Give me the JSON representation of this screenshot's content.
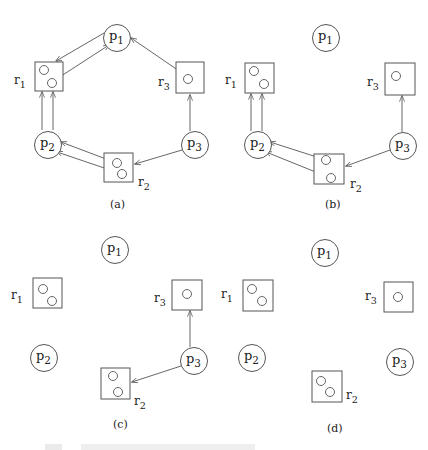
{
  "figure": {
    "stroke_color": "#555555",
    "panels": [
      {
        "id": "a",
        "label": "(a)",
        "label_pos": [
          110,
          208
        ],
        "processes": [
          {
            "name": "p",
            "sub": "1",
            "cx": 117,
            "cy": 38
          },
          {
            "name": "p",
            "sub": "2",
            "cx": 48,
            "cy": 145
          },
          {
            "name": "p",
            "sub": "3",
            "cx": 195,
            "cy": 145
          }
        ],
        "resources": [
          {
            "name": "r",
            "sub": "1",
            "x": 35,
            "y": 62,
            "w": 28,
            "h": 29,
            "label_pos": [
              14,
              84
            ],
            "units": [
              [
                44,
                70
              ],
              [
                52,
                83
              ]
            ]
          },
          {
            "name": "r",
            "sub": "2",
            "x": 104,
            "y": 153,
            "w": 29,
            "h": 29,
            "label_pos": [
              138,
              186
            ],
            "units": [
              [
                117,
                163
              ],
              [
                122,
                174
              ]
            ]
          },
          {
            "name": "r",
            "sub": "3",
            "x": 176,
            "y": 62,
            "w": 28,
            "h": 31,
            "label_pos": [
              158,
              86
            ],
            "units": [
              [
                188,
                79
              ]
            ]
          }
        ],
        "edges": [
          {
            "from": [
              104,
              33
            ],
            "to": [
              56,
              61
            ],
            "type": "request"
          },
          {
            "from": [
              55,
              80
            ],
            "to": [
              109,
              45
            ],
            "type": "assignment"
          },
          {
            "from": [
              185,
              75
            ],
            "to": [
              131,
              38
            ],
            "type": "assignment"
          },
          {
            "from": [
              42,
              130
            ],
            "to": [
              42,
              92
            ],
            "type": "request"
          },
          {
            "from": [
              53,
              130
            ],
            "to": [
              53,
              92
            ],
            "type": "request"
          },
          {
            "from": [
              114,
              162
            ],
            "to": [
              61,
              142
            ],
            "type": "assignment"
          },
          {
            "from": [
              119,
              173
            ],
            "to": [
              57,
              152
            ],
            "type": "assignment"
          },
          {
            "from": [
              182,
              150
            ],
            "to": [
              135,
              164
            ],
            "type": "request"
          },
          {
            "from": [
              190,
              131
            ],
            "to": [
              190,
              95
            ],
            "type": "request"
          }
        ]
      },
      {
        "id": "b",
        "label": "(b)",
        "label_pos": [
          325,
          208
        ],
        "processes": [
          {
            "name": "p",
            "sub": "1",
            "cx": 326,
            "cy": 38
          },
          {
            "name": "p",
            "sub": "2",
            "cx": 258,
            "cy": 145
          },
          {
            "name": "p",
            "sub": "3",
            "cx": 403,
            "cy": 146
          }
        ],
        "resources": [
          {
            "name": "r",
            "sub": "1",
            "x": 245,
            "y": 63,
            "w": 29,
            "h": 30,
            "label_pos": [
              225,
              84
            ],
            "units": [
              [
                254,
                71
              ],
              [
                264,
                84
              ]
            ]
          },
          {
            "name": "r",
            "sub": "2",
            "x": 314,
            "y": 154,
            "w": 30,
            "h": 30,
            "label_pos": [
              350,
              188
            ],
            "units": [
              [
                326,
                160
              ],
              [
                331,
                178
              ]
            ]
          },
          {
            "name": "r",
            "sub": "3",
            "x": 385,
            "y": 63,
            "w": 30,
            "h": 32,
            "label_pos": [
              367,
              86
            ],
            "units": [
              [
                396,
                76
              ]
            ]
          }
        ],
        "edges": [
          {
            "from": [
              251,
              131
            ],
            "to": [
              251,
              94
            ],
            "type": "request"
          },
          {
            "from": [
              262,
              131
            ],
            "to": [
              262,
              94
            ],
            "type": "request"
          },
          {
            "from": [
              323,
              159
            ],
            "to": [
              270,
              142
            ],
            "type": "assignment"
          },
          {
            "from": [
              328,
              177
            ],
            "to": [
              266,
              152
            ],
            "type": "assignment"
          },
          {
            "from": [
              390,
              150
            ],
            "to": [
              346,
              166
            ],
            "type": "request"
          },
          {
            "from": [
              402,
              132
            ],
            "to": [
              402,
              96
            ],
            "type": "request"
          }
        ]
      },
      {
        "id": "c",
        "label": "(c)",
        "label_pos": [
          113,
          428
        ],
        "processes": [
          {
            "name": "p",
            "sub": "1",
            "cx": 115,
            "cy": 250
          },
          {
            "name": "p",
            "sub": "2",
            "cx": 44,
            "cy": 358
          },
          {
            "name": "p",
            "sub": "3",
            "cx": 194,
            "cy": 361
          }
        ],
        "resources": [
          {
            "name": "r",
            "sub": "1",
            "x": 33,
            "y": 278,
            "w": 29,
            "h": 30,
            "label_pos": [
              11,
              299
            ],
            "units": [
              [
                43,
                289
              ],
              [
                52,
                301
              ]
            ]
          },
          {
            "name": "r",
            "sub": "2",
            "x": 101,
            "y": 368,
            "w": 29,
            "h": 31,
            "label_pos": [
              134,
              405
            ],
            "units": [
              [
                113,
                376
              ],
              [
                118,
                392
              ]
            ]
          },
          {
            "name": "r",
            "sub": "3",
            "x": 172,
            "y": 280,
            "w": 30,
            "h": 30,
            "label_pos": [
              154,
              302
            ],
            "units": [
              [
                187,
                294
              ]
            ]
          }
        ],
        "edges": [
          {
            "from": [
              181,
              366
            ],
            "to": [
              132,
              382
            ],
            "type": "request"
          },
          {
            "from": [
              190,
              347
            ],
            "to": [
              190,
              311
            ],
            "type": "request"
          }
        ]
      },
      {
        "id": "d",
        "label": "(d)",
        "label_pos": [
          327,
          432
        ],
        "processes": [
          {
            "name": "p",
            "sub": "1",
            "cx": 325,
            "cy": 253
          },
          {
            "name": "p",
            "sub": "2",
            "cx": 252,
            "cy": 358
          },
          {
            "name": "p",
            "sub": "3",
            "cx": 400,
            "cy": 362
          }
        ],
        "resources": [
          {
            "name": "r",
            "sub": "1",
            "x": 243,
            "y": 280,
            "w": 30,
            "h": 31,
            "label_pos": [
              221,
              298
            ],
            "units": [
              [
                252,
                289
              ],
              [
                262,
                301
              ]
            ]
          },
          {
            "name": "r",
            "sub": "2",
            "x": 312,
            "y": 371,
            "w": 30,
            "h": 31,
            "label_pos": [
              346,
              399
            ],
            "units": [
              [
                321,
                381
              ],
              [
                330,
                392
              ]
            ]
          },
          {
            "name": "r",
            "sub": "3",
            "x": 384,
            "y": 282,
            "w": 29,
            "h": 30,
            "label_pos": [
              365,
              300
            ],
            "units": [
              [
                398,
                297
              ]
            ]
          }
        ],
        "edges": []
      }
    ],
    "caption": ""
  }
}
